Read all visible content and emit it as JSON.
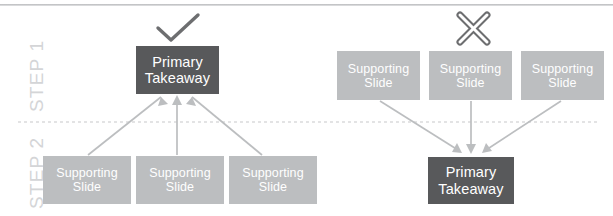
{
  "canvas": {
    "width": 613,
    "height": 216,
    "background": "#ffffff"
  },
  "colors": {
    "primary_box": "#58595b",
    "supporting_box": "#bcbec0",
    "box_text": "#ffffff",
    "step_label": "#d4d5d7",
    "arrow": "#bcbec0",
    "icon": "#6d6e70",
    "divider": "#c7c8ca",
    "top_rule": "#b9babc"
  },
  "divider": {
    "name": "step-divider",
    "style": "dashed",
    "y": 122
  },
  "step_labels": [
    {
      "text": "STEP 1",
      "name": "step-1-label"
    },
    {
      "text": "STEP 2",
      "name": "step-2-label"
    }
  ],
  "panels": [
    {
      "id": "correct",
      "icon": "check-icon",
      "icon_meaning": "correct",
      "step1": {
        "label": "STEP 1",
        "boxes": [
          {
            "type": "primary",
            "line1": "Primary",
            "line2": "Takeaway"
          }
        ]
      },
      "step2": {
        "label": "STEP 2",
        "boxes": [
          {
            "type": "supporting",
            "line1": "Supporting",
            "line2": "Slide"
          },
          {
            "type": "supporting",
            "line1": "Supporting",
            "line2": "Slide"
          },
          {
            "type": "supporting",
            "line1": "Supporting",
            "line2": "Slide"
          }
        ]
      },
      "arrow_direction": "up"
    },
    {
      "id": "incorrect",
      "icon": "cross-icon",
      "icon_meaning": "incorrect",
      "step1": {
        "label": "STEP 1",
        "boxes": [
          {
            "type": "supporting",
            "line1": "Supporting",
            "line2": "Slide"
          },
          {
            "type": "supporting",
            "line1": "Supporting",
            "line2": "Slide"
          },
          {
            "type": "supporting",
            "line1": "Supporting",
            "line2": "Slide"
          }
        ]
      },
      "step2": {
        "label": "STEP 2",
        "boxes": [
          {
            "type": "primary",
            "line1": "Primary",
            "line2": "Takeaway"
          }
        ]
      },
      "arrow_direction": "down"
    }
  ]
}
